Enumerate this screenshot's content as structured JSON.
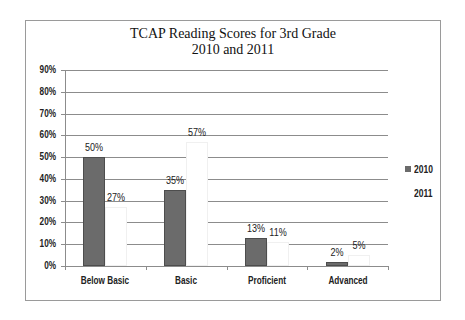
{
  "chart_data": {
    "type": "bar",
    "title": "TCAP Reading Scores for 3rd Grade",
    "subtitle": "2010 and 2011",
    "xlabel": "",
    "ylabel": "",
    "categories": [
      "Below Basic",
      "Basic",
      "Proficient",
      "Advanced"
    ],
    "series": [
      {
        "name": "2010",
        "values": [
          50,
          35,
          13,
          2
        ],
        "labels": [
          "50%",
          "35%",
          "13%",
          "2%"
        ],
        "color": "#6b6b6b"
      },
      {
        "name": "2011",
        "values": [
          27,
          57,
          11,
          5
        ],
        "labels": [
          "27%",
          "57%",
          "11%",
          "5%"
        ],
        "color": "#ffffff"
      }
    ],
    "ylim": [
      0,
      90
    ],
    "yticks": [
      "0%",
      "10%",
      "20%",
      "30%",
      "40%",
      "50%",
      "60%",
      "70%",
      "80%",
      "90%"
    ],
    "grid": true,
    "legend_position": "right"
  }
}
